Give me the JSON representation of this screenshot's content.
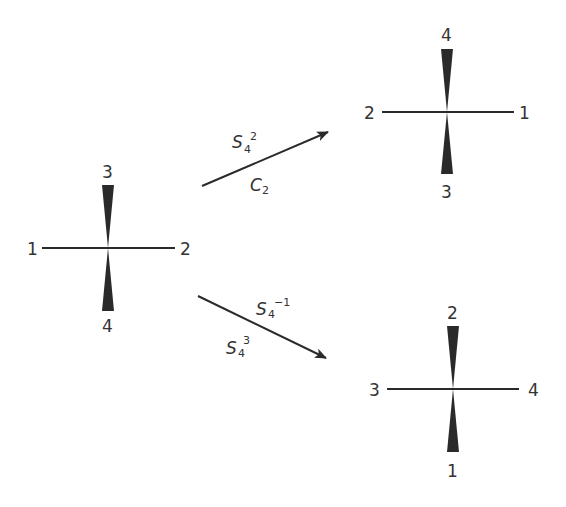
{
  "diagram": {
    "colors": {
      "ink": "#2a2a2a",
      "label": "#333333"
    },
    "molecules": [
      {
        "id": "start",
        "labels": {
          "left": "1",
          "right": "2",
          "top": "3",
          "bottom": "4"
        }
      },
      {
        "id": "result-upper",
        "labels": {
          "left": "2",
          "right": "1",
          "top": "4",
          "bottom": "3"
        }
      },
      {
        "id": "result-lower",
        "labels": {
          "left": "3",
          "right": "4",
          "top": "2",
          "bottom": "1"
        }
      }
    ],
    "arrows": [
      {
        "id": "upper",
        "from": "start",
        "to": "result-upper",
        "label_above": {
          "base": "S",
          "sub": "4",
          "sup": "2"
        },
        "label_below": {
          "base": "C",
          "sub": "2",
          "sup": ""
        }
      },
      {
        "id": "lower",
        "from": "start",
        "to": "result-lower",
        "label_above": {
          "base": "S",
          "sub": "4",
          "sup": "−1"
        },
        "label_below": {
          "base": "S",
          "sub": "4",
          "sup": "3"
        }
      }
    ]
  }
}
